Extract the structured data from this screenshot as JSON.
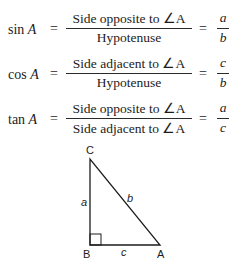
{
  "formulas": [
    {
      "function": "sin",
      "angle": "A",
      "equals": "=",
      "numerator": "Side opposite to ∠A",
      "denominator": "Hypotenuse",
      "ratio_numerator": "a",
      "ratio_denominator": "b"
    },
    {
      "function": "cos",
      "angle": "A",
      "equals": "=",
      "numerator": "Side adjacent to ∠A",
      "denominator": "Hypotenuse",
      "ratio_numerator": "c",
      "ratio_denominator": "b"
    },
    {
      "function": "tan",
      "angle": "A",
      "equals": "=",
      "numerator": "Side opposite to ∠A",
      "denominator": "Side adjacent to ∠A",
      "ratio_numerator": "a",
      "ratio_denominator": "c"
    }
  ],
  "triangle": {
    "vertices": {
      "top": "C",
      "right_angle": "B",
      "acute": "A"
    },
    "sides": {
      "vertical": "a",
      "hypotenuse": "b",
      "base": "c"
    },
    "stroke_color": "#1c1c1c"
  }
}
